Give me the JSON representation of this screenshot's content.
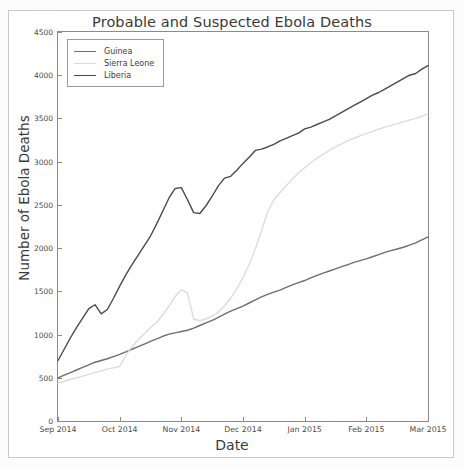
{
  "chart_data": {
    "type": "line",
    "title": "Probable and Suspected Ebola Deaths",
    "xlabel": "Date",
    "ylabel": "Number of Ebola Deaths",
    "ylim": [
      0,
      4500
    ],
    "yticks": [
      0,
      500,
      1000,
      1500,
      2000,
      2500,
      3000,
      3500,
      4000,
      4500
    ],
    "ytick_labels": [
      "0",
      "500",
      "1000",
      "1500",
      "2000",
      "2500",
      "3000",
      "3500",
      "4000",
      "4500"
    ],
    "xtick_labels": [
      "Sep 2014",
      "Oct 2014",
      "Nov 2014",
      "Dec 2014",
      "Jan 2015",
      "Feb 2015",
      "Mar 2015"
    ],
    "xlim_months": [
      0,
      6
    ],
    "grid": false,
    "legend_position": "upper left",
    "series": [
      {
        "name": "Guinea",
        "color": "#6e6e6e",
        "x": [
          0.0,
          0.1,
          0.2,
          0.3,
          0.4,
          0.5,
          0.6,
          0.7,
          0.8,
          0.9,
          1.0,
          1.1,
          1.2,
          1.3,
          1.4,
          1.5,
          1.6,
          1.7,
          1.8,
          1.9,
          2.0,
          2.1,
          2.2,
          2.3,
          2.4,
          2.5,
          2.6,
          2.7,
          2.8,
          2.9,
          3.0,
          3.1,
          3.2,
          3.3,
          3.4,
          3.5,
          3.6,
          3.7,
          3.8,
          3.9,
          4.0,
          4.1,
          4.2,
          4.3,
          4.4,
          4.5,
          4.6,
          4.7,
          4.8,
          4.9,
          5.0,
          5.1,
          5.2,
          5.3,
          5.4,
          5.5,
          5.6,
          5.7,
          5.8,
          5.9,
          6.0
        ],
        "y": [
          500,
          530,
          560,
          590,
          620,
          650,
          680,
          700,
          720,
          745,
          770,
          800,
          830,
          860,
          890,
          920,
          950,
          980,
          1005,
          1020,
          1035,
          1050,
          1075,
          1105,
          1135,
          1165,
          1200,
          1235,
          1270,
          1300,
          1330,
          1365,
          1400,
          1435,
          1465,
          1490,
          1515,
          1545,
          1575,
          1600,
          1625,
          1655,
          1685,
          1710,
          1735,
          1760,
          1785,
          1810,
          1835,
          1855,
          1875,
          1900,
          1925,
          1950,
          1970,
          1990,
          2010,
          2035,
          2060,
          2095,
          2130
        ]
      },
      {
        "name": "Sierra Leone",
        "color": "#dcdcdc",
        "x": [
          0.0,
          0.1,
          0.2,
          0.3,
          0.4,
          0.5,
          0.6,
          0.7,
          0.8,
          0.9,
          1.0,
          1.1,
          1.2,
          1.3,
          1.4,
          1.5,
          1.6,
          1.7,
          1.8,
          1.9,
          2.0,
          2.1,
          2.2,
          2.3,
          2.4,
          2.5,
          2.6,
          2.7,
          2.8,
          2.9,
          3.0,
          3.1,
          3.2,
          3.3,
          3.4,
          3.5,
          3.6,
          3.7,
          3.8,
          3.9,
          4.0,
          4.1,
          4.2,
          4.3,
          4.4,
          4.5,
          4.6,
          4.7,
          4.8,
          4.9,
          5.0,
          5.1,
          5.2,
          5.3,
          5.4,
          5.5,
          5.6,
          5.7,
          5.8,
          5.9,
          6.0
        ],
        "y": [
          440,
          460,
          480,
          500,
          520,
          540,
          560,
          580,
          600,
          615,
          630,
          760,
          860,
          940,
          1010,
          1080,
          1140,
          1230,
          1330,
          1440,
          1520,
          1480,
          1180,
          1160,
          1180,
          1215,
          1260,
          1330,
          1420,
          1530,
          1660,
          1810,
          1990,
          2200,
          2420,
          2560,
          2640,
          2720,
          2800,
          2870,
          2930,
          2990,
          3040,
          3085,
          3130,
          3170,
          3205,
          3240,
          3270,
          3300,
          3325,
          3350,
          3375,
          3400,
          3420,
          3440,
          3460,
          3480,
          3500,
          3525,
          3555
        ]
      },
      {
        "name": "Liberia",
        "color": "#4a4a4a",
        "x": [
          0.0,
          0.1,
          0.2,
          0.3,
          0.4,
          0.5,
          0.6,
          0.7,
          0.8,
          0.9,
          1.0,
          1.1,
          1.2,
          1.3,
          1.4,
          1.5,
          1.6,
          1.7,
          1.8,
          1.9,
          2.0,
          2.1,
          2.2,
          2.3,
          2.4,
          2.5,
          2.6,
          2.7,
          2.8,
          2.9,
          3.0,
          3.1,
          3.2,
          3.3,
          3.4,
          3.5,
          3.6,
          3.7,
          3.8,
          3.9,
          4.0,
          4.1,
          4.2,
          4.3,
          4.4,
          4.5,
          4.6,
          4.7,
          4.8,
          4.9,
          5.0,
          5.1,
          5.2,
          5.3,
          5.4,
          5.5,
          5.6,
          5.7,
          5.8,
          5.9,
          6.0
        ],
        "y": [
          700,
          830,
          960,
          1080,
          1190,
          1300,
          1345,
          1240,
          1290,
          1420,
          1560,
          1690,
          1810,
          1920,
          2030,
          2140,
          2280,
          2430,
          2580,
          2690,
          2700,
          2560,
          2410,
          2400,
          2490,
          2600,
          2720,
          2810,
          2830,
          2900,
          2980,
          3050,
          3130,
          3145,
          3170,
          3200,
          3240,
          3270,
          3300,
          3330,
          3380,
          3400,
          3430,
          3460,
          3490,
          3530,
          3570,
          3610,
          3650,
          3690,
          3730,
          3770,
          3800,
          3840,
          3880,
          3920,
          3960,
          4000,
          4020,
          4070,
          4110
        ]
      }
    ]
  },
  "legend": {
    "entries": [
      {
        "label": "Guinea"
      },
      {
        "label": "Sierra Leone"
      },
      {
        "label": "Liberia"
      }
    ]
  }
}
